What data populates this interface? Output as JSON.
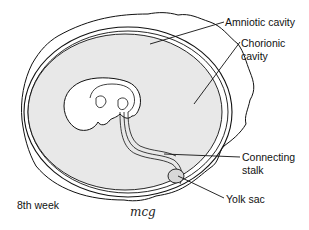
{
  "diagram": {
    "stage_label": "8th week",
    "signature": "mcg",
    "labels": {
      "amniotic_cavity": "Amniotic cavity",
      "chorionic_cavity_line1": "Chorionic",
      "chorionic_cavity_line2": "cavity",
      "connecting_stalk_line1": "Connecting",
      "connecting_stalk_line2": "stalk",
      "yolk_sac": "Yolk sac"
    },
    "colors": {
      "amnion_fill": "#e8e8e8",
      "line": "#111111",
      "background": "#ffffff"
    }
  }
}
